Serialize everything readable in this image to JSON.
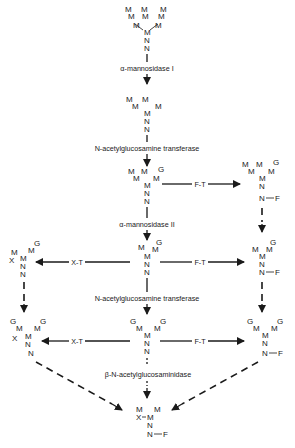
{
  "diagram": {
    "type": "pathway",
    "enzymes": {
      "mannosidase_1": "α-mannosidase I",
      "glcnac_transferase_1": "N-acetylglucosamine transferase",
      "mannosidase_2": "α-mannosidase II",
      "glcnac_transferase_2": "N-acetylglucosamine transferase",
      "hexosaminidase": "β-N-acetylglucosaminidase",
      "fucosyl_transferase": "F-T",
      "xylosyl_transferase": "X-T"
    },
    "residues": {
      "mannose": "M",
      "glcnac": "N",
      "glcnac_terminal": "G",
      "fucose": "F",
      "xylose": "X"
    },
    "bond_labels": {
      "fucose_link": "N–F",
      "xylose_link": "X–M"
    },
    "nodes": [
      {
        "id": "man9",
        "label": "M9 high-mannose"
      },
      {
        "id": "man5",
        "label": "M5"
      },
      {
        "id": "gnman5",
        "label": "GnM5"
      },
      {
        "id": "gnman5f",
        "label": "GnM5 + F"
      },
      {
        "id": "gnman3",
        "label": "GnM3"
      },
      {
        "id": "gnman3x",
        "label": "GnM3 + X"
      },
      {
        "id": "gnman3f",
        "label": "GnM3 + F"
      },
      {
        "id": "gn2man3",
        "label": "Gn2M3"
      },
      {
        "id": "gn2man3x",
        "label": "Gn2M3 + X"
      },
      {
        "id": "gn2man3f",
        "label": "Gn2M3 + F"
      },
      {
        "id": "man3xf",
        "label": "M3XF"
      }
    ]
  }
}
